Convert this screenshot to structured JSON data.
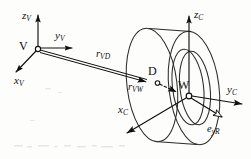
{
  "figure": {
    "kind": "vector-kinematics-diagram",
    "background_color": "#fdfdfc",
    "ink_color": "#101010"
  },
  "frames": {
    "vehicle": {
      "origin_label": "V",
      "origin_marker": "open-circle",
      "axes": [
        {
          "label": "z",
          "subscript": "V",
          "text": "z",
          "sub": "V",
          "direction": "up"
        },
        {
          "label": "y",
          "subscript": "V",
          "text": "y",
          "sub": "V",
          "direction": "right"
        },
        {
          "label": "x",
          "subscript": "V",
          "text": "x",
          "sub": "V",
          "direction": "down-left"
        }
      ]
    },
    "wheel": {
      "origin_label": "W",
      "origin_marker": "open-circle",
      "axes": [
        {
          "label": "z",
          "subscript": "C",
          "text": "z",
          "sub": "C",
          "direction": "up"
        },
        {
          "label": "y",
          "subscript": "C",
          "text": "y",
          "sub": "C",
          "direction": "right"
        },
        {
          "label": "x",
          "subscript": "C",
          "text": "x",
          "sub": "C",
          "direction": "down-left"
        }
      ]
    }
  },
  "points": [
    {
      "id": "V",
      "label": "V",
      "marker": "open-circle"
    },
    {
      "id": "D",
      "label": "D",
      "marker": "open-circle"
    },
    {
      "id": "W",
      "label": "W",
      "marker": "open-circle"
    }
  ],
  "vectors": [
    {
      "id": "rVD",
      "text": "r",
      "sub": "VD",
      "from": "V",
      "to": "D",
      "style": "double-stroke",
      "arrowhead": "solid"
    },
    {
      "id": "rVW",
      "text": "r",
      "sub": "VW",
      "from": "V",
      "to": "W",
      "style": "dashed",
      "arrowhead": "solid"
    },
    {
      "id": "eyR",
      "text": "e",
      "sub": "yR",
      "from": "W",
      "to": "down-right",
      "style": "solid",
      "arrowhead": "hollow"
    }
  ],
  "wheel_body": {
    "shape": "tyre-torus",
    "rings": [
      "outer-far-rim",
      "outer-near-rim",
      "tread-band",
      "inner-hub"
    ],
    "stroke": "#2a2a2a"
  },
  "labels": {
    "zV": "z",
    "zV_sub": "V",
    "yV": "y",
    "yV_sub": "V",
    "xV": "x",
    "xV_sub": "V",
    "zC": "z",
    "zC_sub": "C",
    "yC": "y",
    "yC_sub": "C",
    "xC": "x",
    "xC_sub": "C",
    "rVD": "r",
    "rVD_sub": "VD",
    "rVW": "r",
    "rVW_sub": "VW",
    "eyR": "e",
    "eyR_sub": "yR",
    "V": "V",
    "D": "D",
    "W": "W"
  }
}
